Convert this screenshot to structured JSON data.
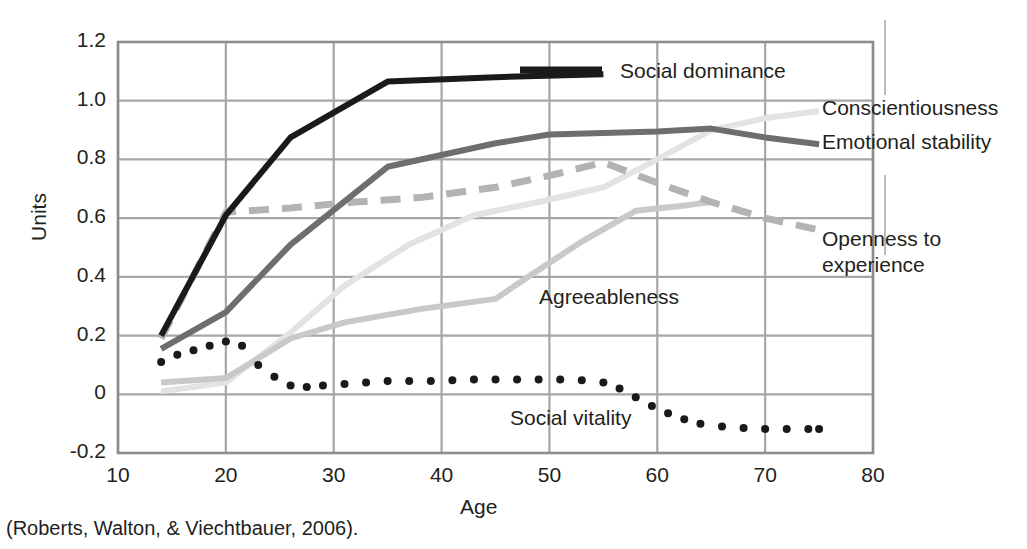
{
  "caption": "(Roberts, Walton, & Viechtbauer, 2006).",
  "axes": {
    "xlabel": "Age",
    "ylabel": "Units",
    "xticks": [
      "10",
      "20",
      "30",
      "40",
      "50",
      "60",
      "70",
      "80"
    ],
    "yticks": [
      "1.2",
      "1.0",
      "0.8",
      "0.6",
      "0.4",
      "0.2",
      "0",
      "-0.2"
    ],
    "grid_color": "#a6a6a6",
    "axis_color": "#8c8c8c"
  },
  "series_labels": [
    {
      "name": "social-dominance",
      "text": "Social dominance",
      "left": 620,
      "top": 58
    },
    {
      "name": "conscientiousness",
      "text": "Conscientiousness",
      "left": 822,
      "top": 95
    },
    {
      "name": "emotional-stability",
      "text": "Emotional stability",
      "left": 822,
      "top": 129
    },
    {
      "name": "openness-to-experience",
      "text": "Openness to\nexperience",
      "left": 822,
      "top": 226
    },
    {
      "name": "agreeableness",
      "text": "Agreeableness",
      "left": 539,
      "top": 284
    },
    {
      "name": "social-vitality",
      "text": "Social vitality",
      "left": 510,
      "top": 405
    }
  ],
  "legend_swatch": {
    "color": "#1a1a1a"
  },
  "chart_data": {
    "type": "line",
    "title": "",
    "xlabel": "Age",
    "ylabel": "Units",
    "xlim": [
      10,
      80
    ],
    "ylim": [
      -0.2,
      1.2
    ],
    "xticks": [
      10,
      20,
      30,
      40,
      50,
      60,
      70,
      80
    ],
    "yticks": [
      -0.2,
      0,
      0.2,
      0.4,
      0.6,
      0.8,
      1.0,
      1.2
    ],
    "grid": true,
    "legend_position": "inline-right-of-line-ends",
    "series": [
      {
        "name": "Social dominance",
        "color": "#1a1a1a",
        "style": "solid",
        "width": 6,
        "x": [
          14,
          20,
          26,
          35,
          45,
          55
        ],
        "y": [
          0.2,
          0.61,
          0.875,
          1.065,
          1.08,
          1.09
        ]
      },
      {
        "name": "Emotional stability",
        "color": "#6e6e6e",
        "style": "solid",
        "width": 6,
        "x": [
          14,
          20,
          26,
          35,
          45,
          50,
          55,
          60,
          65,
          70,
          75
        ],
        "y": [
          0.155,
          0.28,
          0.51,
          0.775,
          0.855,
          0.885,
          0.89,
          0.895,
          0.905,
          0.875,
          0.852
        ]
      },
      {
        "name": "Conscientiousness",
        "color": "#e3e3e3",
        "style": "solid",
        "width": 6,
        "x": [
          14,
          20,
          26,
          31,
          37,
          43,
          49,
          55,
          60,
          65,
          70,
          75
        ],
        "y": [
          0.01,
          0.04,
          0.21,
          0.37,
          0.51,
          0.61,
          0.655,
          0.705,
          0.8,
          0.9,
          0.94,
          0.965
        ]
      },
      {
        "name": "Openness to experience",
        "color": "#b3b3b3",
        "style": "dashed",
        "width": 7,
        "x": [
          14,
          20,
          26,
          32,
          38,
          45,
          50,
          55,
          60,
          65,
          70,
          75
        ],
        "y": [
          0.19,
          0.62,
          0.635,
          0.655,
          0.67,
          0.705,
          0.745,
          0.79,
          0.72,
          0.655,
          0.6,
          0.56
        ]
      },
      {
        "name": "Agreeableness",
        "color": "#c9c9c9",
        "style": "solid",
        "width": 6,
        "x": [
          14,
          20,
          26,
          31,
          38,
          45,
          48,
          53,
          58,
          63,
          65
        ],
        "y": [
          0.04,
          0.055,
          0.19,
          0.245,
          0.29,
          0.325,
          0.4,
          0.52,
          0.625,
          0.645,
          0.655
        ]
      },
      {
        "name": "Social vitality",
        "color": "#1a1a1a",
        "style": "dotted",
        "width": 8,
        "x": [
          14,
          15.5,
          17,
          18.5,
          20,
          21.5,
          23,
          24.5,
          26,
          27.5,
          29,
          31,
          33,
          35,
          37,
          39,
          41,
          43,
          45,
          47,
          49,
          51,
          53,
          55,
          56.5,
          58,
          59.5,
          61,
          62.5,
          64,
          66,
          68,
          70,
          72,
          74,
          75
        ],
        "y": [
          0.11,
          0.135,
          0.15,
          0.165,
          0.18,
          0.165,
          0.1,
          0.06,
          0.03,
          0.025,
          0.03,
          0.035,
          0.04,
          0.045,
          0.045,
          0.045,
          0.048,
          0.05,
          0.05,
          0.05,
          0.05,
          0.05,
          0.048,
          0.04,
          0.02,
          -0.01,
          -0.04,
          -0.065,
          -0.085,
          -0.1,
          -0.11,
          -0.115,
          -0.118,
          -0.118,
          -0.118,
          -0.118
        ]
      }
    ]
  }
}
